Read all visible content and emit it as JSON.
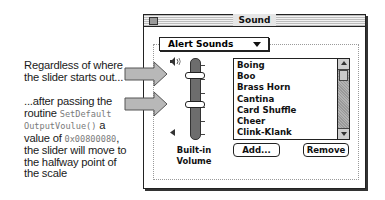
{
  "annotations": {
    "top": {
      "line1": "Regardless of where",
      "line2": "the slider starts out..."
    },
    "bottom": {
      "line1": "...after passing the",
      "line2_text": "routine ",
      "line2_code": "SetDefault",
      "line3_code": "OutputVoulue()",
      "line3_text": " a",
      "line4_text": "value of ",
      "line4_code": "0x00800080",
      "line4_end": ",",
      "line5": "the slider will move to",
      "line6": "the halfway point of",
      "line7": "the scale"
    }
  },
  "window": {
    "title": "Sound",
    "popup": {
      "selected": "Alert Sounds"
    },
    "slider": {
      "label_line1": "Built-in",
      "label_line2": "Volume",
      "thumb_before_pct": 20,
      "thumb_after_pct": 50
    },
    "sound_list": {
      "items": [
        "Boing",
        "Boo",
        "Brass Horn",
        "Cantina",
        "Card Shuffle",
        "Cheer",
        "Clink-Klank"
      ]
    },
    "buttons": {
      "add": "Add...",
      "remove": "Remove"
    }
  },
  "colors": {
    "arrow_fill": "#b8b8b8",
    "arrow_stroke": "#555555",
    "track": "#6d6d6d",
    "mono_text": "#7a7a7a"
  }
}
